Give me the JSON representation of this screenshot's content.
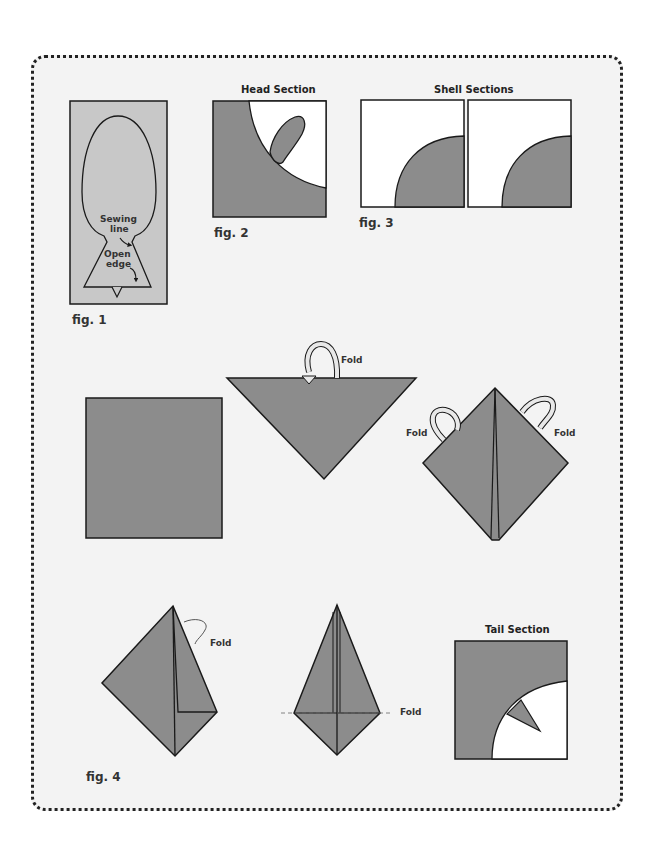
{
  "colors": {
    "fabric": "#8c8c8c",
    "light_fabric": "#c8c8c8",
    "outline": "#1a1a1a",
    "background": "#f3f3f3",
    "arrow_fill": "#e8e8e8"
  },
  "fig1": {
    "caption": "fig. 1",
    "sewing_line_label_1": "Sewing",
    "sewing_line_label_2": "line",
    "open_edge_label_1": "Open",
    "open_edge_label_2": "edge"
  },
  "fig2": {
    "title": "Head Section",
    "caption": "fig. 2"
  },
  "fig3": {
    "title": "Shell Sections",
    "caption": "fig. 3"
  },
  "fig4": {
    "caption": "fig. 4",
    "fold_label": "Fold",
    "steps": [
      {
        "step": 1,
        "shape": "square"
      },
      {
        "step": 2,
        "shape": "triangle",
        "label": "Fold"
      },
      {
        "step": 3,
        "shape": "diamond",
        "labels": [
          "Fold",
          "Fold"
        ]
      },
      {
        "step": 4,
        "shape": "kite-half-folded",
        "label": "Fold"
      },
      {
        "step": 5,
        "shape": "kite",
        "label": "Fold"
      },
      {
        "step": 6,
        "shape": "tail-section",
        "title": "Tail Section"
      }
    ],
    "tail_title": "Tail Section"
  }
}
